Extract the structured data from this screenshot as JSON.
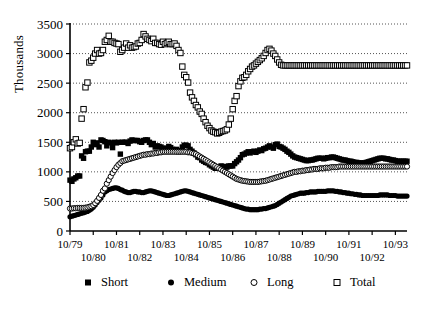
{
  "chart_data": {
    "type": "scatter",
    "title": "",
    "xlabel": "",
    "ylabel": "Thousands",
    "ylim": [
      0,
      3500
    ],
    "yticks": [
      0,
      500,
      1000,
      1500,
      2000,
      2500,
      3000,
      3500
    ],
    "grid": true,
    "legend_position": "bottom",
    "x_tick_labels_row1": [
      "10/79",
      "10/81",
      "10/83",
      "10/85",
      "10/87",
      "10/89",
      "10/91",
      "10/93"
    ],
    "x_tick_labels_row2": [
      "10/80",
      "10/82",
      "10/84",
      "10/86",
      "10/88",
      "10/90",
      "10/92"
    ],
    "x_start": "10/79",
    "x_end": "10/93",
    "x_interval": "monthly",
    "series": [
      {
        "name": "Short",
        "marker": "filled-square",
        "color": "#000000",
        "values": [
          860,
          840,
          880,
          900,
          930,
          930,
          1270,
          1230,
          1340,
          1350,
          1350,
          1420,
          1500,
          1460,
          1490,
          1420,
          1540,
          1530,
          1510,
          1440,
          1500,
          1490,
          1410,
          1500,
          1490,
          1500,
          1300,
          1500,
          1500,
          1500,
          1480,
          1520,
          1540,
          1530,
          1530,
          1530,
          1510,
          1500,
          1530,
          1540,
          1540,
          1500,
          1460,
          1480,
          1420,
          1440,
          1430,
          1420,
          1400,
          1390,
          1400,
          1430,
          1410,
          1380,
          1360,
          1380,
          1340,
          1360,
          1420,
          1450,
          1450,
          1440,
          1380,
          1350,
          1320,
          1290,
          1250,
          1240,
          1200,
          1180,
          1160,
          1150,
          1120,
          1100,
          1080,
          1060,
          1060,
          1080,
          1100,
          1090,
          1090,
          1080,
          1100,
          1100,
          1100,
          1140,
          1170,
          1200,
          1240,
          1290,
          1300,
          1320,
          1340,
          1320,
          1340,
          1350,
          1330,
          1350,
          1370,
          1360,
          1390,
          1400,
          1420,
          1440,
          1420,
          1400,
          1460,
          1470,
          1430,
          1420,
          1400,
          1380,
          1350,
          1330,
          1300,
          1270,
          1250,
          1240,
          1230,
          1220,
          1210,
          1200,
          1190,
          1190,
          1200,
          1200,
          1210,
          1220,
          1230,
          1230,
          1230,
          1220,
          1230,
          1240,
          1240,
          1250,
          1250,
          1240,
          1230,
          1220,
          1210,
          1200,
          1200,
          1190,
          1180,
          1180,
          1170,
          1160,
          1160,
          1150,
          1150,
          1150,
          1150,
          1160,
          1170,
          1180,
          1190,
          1200,
          1210,
          1220,
          1230,
          1230,
          1230,
          1220,
          1220,
          1210,
          1200,
          1200,
          1190,
          1180,
          1180,
          1180,
          1180,
          1180,
          1180
        ]
      },
      {
        "name": "Medium",
        "marker": "filled-circle",
        "color": "#000000",
        "values": [
          240,
          250,
          260,
          270,
          280,
          290,
          300,
          310,
          320,
          330,
          350,
          370,
          400,
          440,
          480,
          520,
          560,
          610,
          660,
          680,
          700,
          710,
          720,
          730,
          730,
          720,
          700,
          690,
          670,
          660,
          650,
          650,
          660,
          670,
          670,
          660,
          660,
          650,
          650,
          660,
          670,
          680,
          680,
          670,
          660,
          650,
          640,
          630,
          620,
          610,
          600,
          600,
          610,
          620,
          630,
          640,
          650,
          660,
          670,
          680,
          680,
          670,
          660,
          650,
          640,
          630,
          620,
          610,
          600,
          590,
          580,
          570,
          560,
          550,
          540,
          530,
          520,
          510,
          500,
          490,
          480,
          470,
          460,
          450,
          440,
          430,
          420,
          410,
          400,
          390,
          380,
          370,
          370,
          360,
          360,
          360,
          360,
          360,
          370,
          370,
          380,
          380,
          390,
          400,
          410,
          420,
          430,
          450,
          470,
          490,
          510,
          530,
          550,
          570,
          590,
          600,
          610,
          620,
          630,
          640,
          640,
          640,
          650,
          650,
          660,
          660,
          660,
          660,
          670,
          670,
          670,
          670,
          670,
          680,
          680,
          680,
          680,
          670,
          670,
          660,
          660,
          650,
          650,
          640,
          640,
          630,
          630,
          620,
          620,
          610,
          610,
          600,
          600,
          600,
          600,
          600,
          600,
          600,
          600,
          600,
          610,
          610,
          610,
          610,
          610,
          600,
          600,
          600,
          600,
          590,
          590,
          590,
          590,
          590,
          590
        ]
      },
      {
        "name": "Long",
        "marker": "open-circle",
        "color": "#000000",
        "values": [
          380,
          380,
          385,
          385,
          390,
          390,
          390,
          390,
          395,
          400,
          410,
          420,
          440,
          470,
          510,
          560,
          610,
          680,
          720,
          800,
          860,
          920,
          980,
          1030,
          1080,
          1120,
          1150,
          1180,
          1190,
          1200,
          1210,
          1220,
          1230,
          1240,
          1250,
          1260,
          1270,
          1280,
          1290,
          1290,
          1300,
          1300,
          1310,
          1310,
          1320,
          1320,
          1330,
          1330,
          1340,
          1340,
          1340,
          1340,
          1340,
          1340,
          1340,
          1340,
          1340,
          1340,
          1340,
          1340,
          1340,
          1330,
          1330,
          1320,
          1310,
          1300,
          1280,
          1260,
          1240,
          1220,
          1200,
          1180,
          1160,
          1140,
          1120,
          1100,
          1080,
          1060,
          1040,
          1020,
          1000,
          980,
          960,
          940,
          920,
          900,
          880,
          870,
          860,
          850,
          845,
          840,
          835,
          830,
          830,
          830,
          830,
          830,
          835,
          840,
          845,
          850,
          860,
          870,
          880,
          890,
          900,
          910,
          920,
          930,
          940,
          950,
          960,
          970,
          980,
          990,
          1000,
          1000,
          1010,
          1010,
          1020,
          1020,
          1030,
          1030,
          1040,
          1040,
          1050,
          1050,
          1050,
          1060,
          1060,
          1060,
          1070,
          1070,
          1070,
          1080,
          1080,
          1080,
          1080,
          1090,
          1090,
          1090,
          1090,
          1090,
          1090,
          1090,
          1090,
          1090,
          1090,
          1090,
          1090,
          1090,
          1090,
          1090,
          1090,
          1090,
          1090,
          1090,
          1090,
          1090,
          1090,
          1090,
          1090,
          1090,
          1090,
          1090,
          1090,
          1090,
          1090,
          1090,
          1090,
          1090,
          1090,
          1090,
          1090
        ]
      },
      {
        "name": "Total",
        "marker": "open-square",
        "color": "#000000",
        "values": [
          1400,
          1420,
          1500,
          1550,
          1480,
          1490,
          1900,
          2060,
          2430,
          2510,
          2850,
          2880,
          2930,
          3000,
          3060,
          3000,
          3010,
          3060,
          3200,
          3230,
          3300,
          3200,
          3200,
          3180,
          3170,
          3160,
          3030,
          3060,
          3100,
          3170,
          3100,
          3140,
          3100,
          3110,
          3120,
          3170,
          3180,
          3230,
          3330,
          3290,
          3250,
          3230,
          3210,
          3250,
          3180,
          3180,
          3160,
          3150,
          3200,
          3160,
          3180,
          3200,
          3160,
          3160,
          3170,
          3130,
          3060,
          3010,
          2780,
          2640,
          2600,
          2510,
          2340,
          2260,
          2200,
          2130,
          2090,
          2020,
          1980,
          1900,
          1840,
          1780,
          1740,
          1700,
          1680,
          1670,
          1650,
          1660,
          1680,
          1690,
          1700,
          1720,
          1800,
          1900,
          2060,
          2200,
          2280,
          2450,
          2530,
          2590,
          2600,
          2640,
          2700,
          2740,
          2780,
          2800,
          2830,
          2860,
          2890,
          2920,
          2960,
          3010,
          3060,
          3080,
          3050,
          3000,
          2960,
          2900,
          2850,
          2810,
          2800,
          2800,
          2800,
          2800,
          2800,
          2800,
          2800,
          2800,
          2800,
          2800,
          2800,
          2800,
          2800,
          2800,
          2800,
          2800,
          2800,
          2800,
          2800,
          2800,
          2800,
          2800,
          2800,
          2800,
          2800,
          2800,
          2800,
          2800,
          2800,
          2800,
          2800,
          2800,
          2800,
          2800,
          2800,
          2800,
          2800,
          2800,
          2800,
          2800,
          2800,
          2800,
          2800,
          2800,
          2800,
          2800,
          2800,
          2800,
          2800,
          2800,
          2800,
          2800,
          2800,
          2800,
          2800,
          2800,
          2800,
          2800,
          2800,
          2800,
          2800,
          2800,
          2800,
          2800,
          2800
        ]
      }
    ]
  },
  "legend": {
    "items": [
      {
        "label": "Short",
        "marker": "filled-square"
      },
      {
        "label": "Medium",
        "marker": "filled-circle"
      },
      {
        "label": "Long",
        "marker": "open-circle"
      },
      {
        "label": "Total",
        "marker": "open-square"
      }
    ]
  }
}
